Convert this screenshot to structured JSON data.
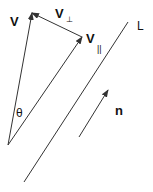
{
  "diagram": {
    "colors": {
      "stroke": "#333333",
      "text": "#111111",
      "background": "#ffffff"
    },
    "labels": {
      "v": "V",
      "v_perp_base": "V",
      "v_perp_sub": "⊥",
      "v_par_base": "V",
      "v_par_sub": "||",
      "line": "L",
      "normal": "n",
      "angle": "θ"
    },
    "vectors": [
      {
        "name": "V",
        "from": [
          8,
          145
        ],
        "to": [
          32,
          13
        ]
      },
      {
        "name": "V_parallel",
        "from": [
          8,
          145
        ],
        "to": [
          82,
          37
        ]
      },
      {
        "name": "V_perp",
        "from": [
          82,
          37
        ],
        "to": [
          32,
          13
        ]
      },
      {
        "name": "n",
        "from": [
          79,
          137
        ],
        "to": [
          108,
          90
        ]
      }
    ],
    "lines": [
      {
        "name": "L",
        "from": [
          24,
          182
        ],
        "to": [
          128,
          22
        ]
      }
    ]
  }
}
